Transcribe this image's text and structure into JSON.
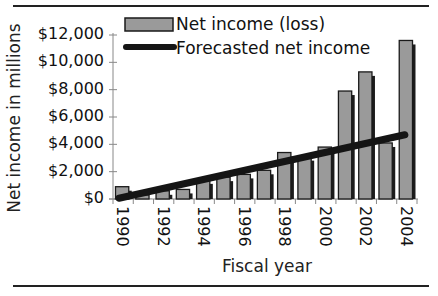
{
  "chart_data": {
    "type": "bar",
    "title": "",
    "xlabel": "Fiscal year",
    "ylabel": "Net income in millions",
    "ylim": [
      0,
      12000
    ],
    "yticks": [
      "$0",
      "$2,000",
      "$4,000",
      "$6,000",
      "$8,000",
      "$10,000",
      "$12,000"
    ],
    "xtick_labels": [
      "1990",
      "1992",
      "1994",
      "1996",
      "1998",
      "2000",
      "2002",
      "2004"
    ],
    "categories": [
      "1990",
      "1991",
      "1992",
      "1993",
      "1994",
      "1995",
      "1996",
      "1997",
      "1998",
      "1999",
      "2000",
      "2001",
      "2002",
      "2003",
      "2004"
    ],
    "series": [
      {
        "name": "Net income (loss)",
        "type": "bar",
        "values": [
          900,
          300,
          600,
          700,
          1400,
          1600,
          1800,
          2100,
          3400,
          3100,
          3800,
          7900,
          9300,
          4100,
          11600
        ]
      },
      {
        "name": "Forecasted net income",
        "type": "line",
        "values": [
          200,
          530,
          860,
          1190,
          1520,
          1850,
          2180,
          2510,
          2840,
          3170,
          3500,
          3830,
          4160,
          4490,
          4700
        ]
      }
    ],
    "legend_position": "top-inside",
    "grid": false
  },
  "legend": {
    "items": [
      {
        "label": "Net income (loss)",
        "swatch": "bar"
      },
      {
        "label": "Forecasted net income",
        "swatch": "line"
      }
    ]
  },
  "colors": {
    "bar_fill": "#9a9a9a",
    "bar_border": "#1a1a1a",
    "bar_shadow": "#1c1c1c",
    "trend_line": "#151515",
    "axis": "#888888"
  }
}
